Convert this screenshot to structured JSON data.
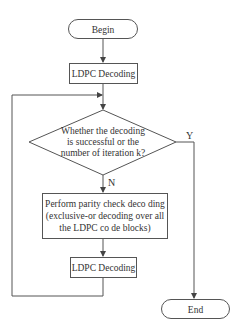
{
  "diagram": {
    "type": "flowchart",
    "nodes": {
      "begin": {
        "shape": "terminal",
        "label": "Begin"
      },
      "ldpc1": {
        "shape": "process",
        "label": "LDPC Decoding"
      },
      "decision": {
        "shape": "decision",
        "lines": [
          "Whether the decoding",
          "is successful or the",
          "number of iteration k?"
        ]
      },
      "parity": {
        "shape": "process",
        "lines": [
          "Perform parity check deco ding",
          "(exclusive-or decoding over all",
          "the LDPC co de blocks)"
        ]
      },
      "ldpc2": {
        "shape": "process",
        "label": "LDPC Decoding"
      },
      "end": {
        "shape": "terminal",
        "label": "End"
      }
    },
    "edges": [
      {
        "from": "begin",
        "to": "ldpc1",
        "label": ""
      },
      {
        "from": "ldpc1",
        "to": "decision",
        "label": ""
      },
      {
        "from": "decision",
        "to": "end",
        "label": "Y"
      },
      {
        "from": "decision",
        "to": "parity",
        "label": "N"
      },
      {
        "from": "parity",
        "to": "ldpc2",
        "label": ""
      },
      {
        "from": "ldpc2",
        "to": "decision",
        "label": "",
        "type": "loop-back"
      }
    ],
    "labels": {
      "yes": "Y",
      "no": "N"
    }
  }
}
